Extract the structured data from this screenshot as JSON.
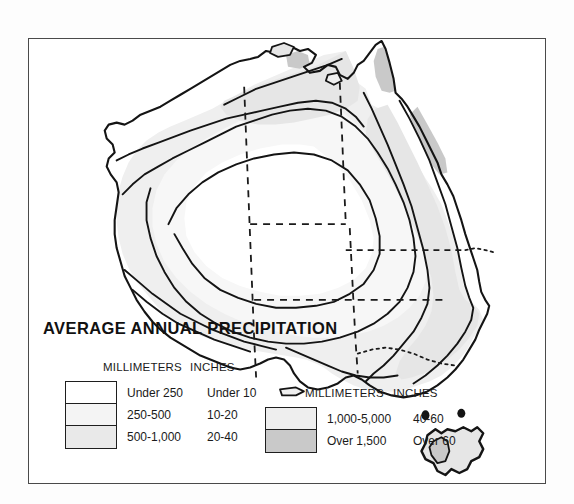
{
  "figure": {
    "title": "AVERAGE ANNUAL PRECIPITATION",
    "frame": {
      "border_color": "#4a4a4a"
    },
    "background_color": "#ffffff"
  },
  "legend_left": {
    "header_millimeters": "MILLIMETERS",
    "header_inches": "INCHES",
    "rows": [
      {
        "swatch": "white",
        "color": "#ffffff",
        "millimeters": "Under 250",
        "inches": "Under 10"
      },
      {
        "swatch": "light-1",
        "color": "#f4f4f4",
        "millimeters": "250-500",
        "inches": "10-20"
      },
      {
        "swatch": "light-2",
        "color": "#e9e9e9",
        "millimeters": "500-1,000",
        "inches": "20-40"
      }
    ]
  },
  "legend_right": {
    "header_millimeters": "MILLIMETERS",
    "header_inches": "INCHES",
    "rows": [
      {
        "swatch": "light-3",
        "color": "#eeeeee",
        "millimeters": "1,000-5,000",
        "inches": "40-60"
      },
      {
        "swatch": "dark",
        "color": "#c9c9c9",
        "millimeters": "Over 1,500",
        "inches": "Over 60"
      }
    ]
  },
  "map": {
    "region_name": "Australia",
    "islands": [
      "Tasmania"
    ],
    "features": [
      "coastline",
      "precipitation-isohyet-contours",
      "state-boundaries-dashed"
    ],
    "contour_stroke": "#141414",
    "boundary_stroke": "#1a1a1a",
    "fill_under_250": "#ffffff",
    "fill_250_500": "#f7f7f7",
    "fill_500_1000": "#efefef",
    "fill_1000_5000": "#e6e6e6",
    "fill_over_1500": "#c9c9c9"
  }
}
